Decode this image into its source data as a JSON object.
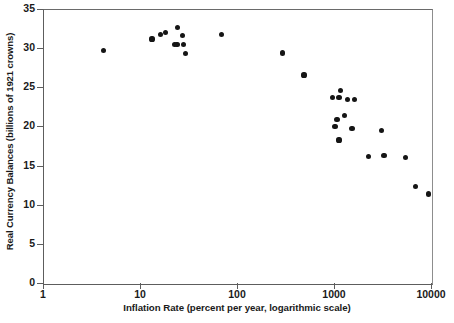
{
  "chart_data": {
    "type": "scatter",
    "title": "",
    "subtitle": "",
    "xlabel": "Inflation Rate (percent per year, logarithmic scale)",
    "ylabel": "Real Currency Balances (billions of 1921 crowns)",
    "xscale": "log",
    "yscale": "linear",
    "xlim": [
      1,
      10000
    ],
    "ylim": [
      0,
      35
    ],
    "xticks": [
      1,
      10,
      100,
      1000,
      10000
    ],
    "xticklabels": [
      "1",
      "10",
      "100",
      "1000",
      "10000"
    ],
    "yticks": [
      0,
      5,
      10,
      15,
      20,
      25,
      30,
      35
    ],
    "yticklabels": [
      "0",
      "5",
      "10",
      "15",
      "20",
      "25",
      "30",
      "35"
    ],
    "grid": false,
    "legend": null,
    "marker": "filled-circle",
    "marker_color": "#151515",
    "annotations": [],
    "points": [
      {
        "x": 4.1,
        "y": 29.8
      },
      {
        "x": 13.0,
        "y": 31.3
      },
      {
        "x": 16.0,
        "y": 31.9
      },
      {
        "x": 18.0,
        "y": 32.1
      },
      {
        "x": 22.0,
        "y": 30.6
      },
      {
        "x": 23.5,
        "y": 30.6
      },
      {
        "x": 24.0,
        "y": 32.8
      },
      {
        "x": 27.0,
        "y": 31.7
      },
      {
        "x": 27.5,
        "y": 30.6
      },
      {
        "x": 29.0,
        "y": 29.4
      },
      {
        "x": 67.0,
        "y": 31.9
      },
      {
        "x": 290.0,
        "y": 29.5
      },
      {
        "x": 480.0,
        "y": 26.7
      },
      {
        "x": 950.0,
        "y": 23.8
      },
      {
        "x": 1100.0,
        "y": 23.8
      },
      {
        "x": 1150.0,
        "y": 24.7
      },
      {
        "x": 1350.0,
        "y": 23.6
      },
      {
        "x": 1600.0,
        "y": 23.6
      },
      {
        "x": 1050.0,
        "y": 21.0
      },
      {
        "x": 1250.0,
        "y": 21.5
      },
      {
        "x": 1000.0,
        "y": 20.1
      },
      {
        "x": 1500.0,
        "y": 19.9
      },
      {
        "x": 1100.0,
        "y": 18.4
      },
      {
        "x": 2200.0,
        "y": 16.3
      },
      {
        "x": 3000.0,
        "y": 19.6
      },
      {
        "x": 3200.0,
        "y": 16.4
      },
      {
        "x": 5300.0,
        "y": 16.2
      },
      {
        "x": 6700.0,
        "y": 12.5
      },
      {
        "x": 9200.0,
        "y": 11.5
      }
    ]
  },
  "axes": {
    "x_axis_title": "Inflation Rate (percent per year, logarithmic scale)",
    "y_axis_title": "Real Currency Balances (billions of 1921 crowns)"
  },
  "colors": {
    "marker": "#151515",
    "axis": "#5d5d5d",
    "background": "#ffffff",
    "text": "#1a1a1a"
  }
}
